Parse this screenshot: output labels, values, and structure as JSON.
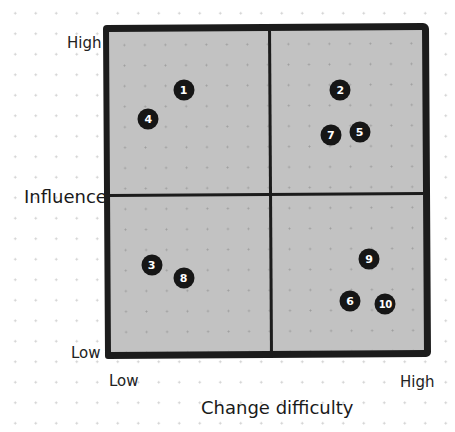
{
  "chart": {
    "y_axis": {
      "title": "Influence",
      "high_label": "High",
      "low_label": "Low"
    },
    "x_axis": {
      "title": "Change difficulty",
      "low_label": "Low",
      "high_label": "High"
    }
  },
  "colors": {
    "quadrant_fill": "#c2c2c2",
    "border": "#1c1c1c",
    "marker": "#161616",
    "marker_text": "#ffffff"
  },
  "chart_data": {
    "type": "scatter",
    "title": "",
    "xlabel": "Change difficulty",
    "ylabel": "Influence",
    "x_tick_labels": [
      "Low",
      "High"
    ],
    "y_tick_labels": [
      "Low",
      "High"
    ],
    "xlim": [
      0,
      10
    ],
    "ylim": [
      0,
      10
    ],
    "quadrant_split": {
      "x": 5,
      "y": 5
    },
    "grid": false,
    "points": [
      {
        "label": "1",
        "x": 2.3,
        "y": 8.2
      },
      {
        "label": "2",
        "x": 7.2,
        "y": 8.2
      },
      {
        "label": "3",
        "x": 1.3,
        "y": 2.8
      },
      {
        "label": "4",
        "x": 1.2,
        "y": 7.3
      },
      {
        "label": "5",
        "x": 7.8,
        "y": 6.9
      },
      {
        "label": "6",
        "x": 7.5,
        "y": 1.7
      },
      {
        "label": "7",
        "x": 6.9,
        "y": 6.8
      },
      {
        "label": "8",
        "x": 2.3,
        "y": 2.4
      },
      {
        "label": "9",
        "x": 8.1,
        "y": 3.0
      },
      {
        "label": "10",
        "x": 8.6,
        "y": 1.6
      }
    ]
  }
}
